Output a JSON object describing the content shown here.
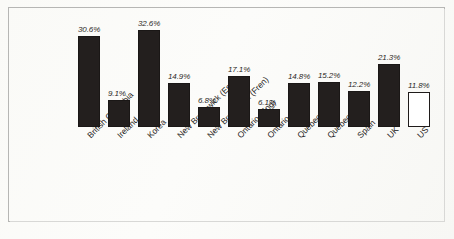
{
  "chart_data": {
    "type": "bar",
    "title": "",
    "subtitle": "",
    "xlabel": "",
    "ylabel": "",
    "ylim": [
      0,
      34
    ],
    "grid": false,
    "legend": "none",
    "value_label_suffix": "%",
    "categories": [
      "British Columbia",
      "Ireland",
      "Korea",
      "New Brunswick (Eng)",
      "New Brunswick (Fren)",
      "Ontario (Eng)",
      "Ontario (Fren)",
      "Quebec (Eng)",
      "Quebec (Fren)",
      "Spain",
      "UK",
      "US"
    ],
    "values": [
      30.6,
      9.1,
      32.6,
      14.9,
      6.8,
      17.1,
      6.1,
      14.8,
      15.2,
      12.2,
      21.3,
      11.8
    ],
    "value_labels": [
      "30.6%",
      "9.1%",
      "32.6%",
      "14.9%",
      "6.8%",
      "17.1%",
      "6.1%",
      "14.8%",
      "15.2%",
      "12.2%",
      "21.3%",
      "11.8%"
    ],
    "bar_styles": [
      "filled",
      "filled",
      "filled",
      "filled",
      "filled",
      "filled",
      "filled",
      "filled",
      "filled",
      "filled",
      "filled",
      "hollow"
    ],
    "colors": {
      "bar_fill": "#231f1e",
      "bar_outline": "#1f1b1a",
      "hollow_fill": "#ffffff",
      "label_text": "#2b2826",
      "frame": "#b6b6b4",
      "background": "#fbfbf9"
    }
  }
}
